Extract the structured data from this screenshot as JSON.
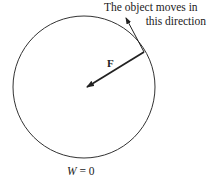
{
  "diagram": {
    "caption_line1": "The object moves in",
    "caption_line2": "this direction",
    "force_label": "F",
    "work_symbol": "W",
    "work_equals": " = 0",
    "circle": {
      "cx": 84,
      "cy": 87,
      "r": 71
    },
    "force_vector": {
      "from": [
        144,
        52
      ],
      "to": [
        86,
        88
      ]
    },
    "velocity_vector": {
      "from": [
        144,
        52
      ],
      "to": [
        125,
        16
      ]
    },
    "colors": {
      "stroke": "#222222",
      "background": "#ffffff"
    }
  }
}
